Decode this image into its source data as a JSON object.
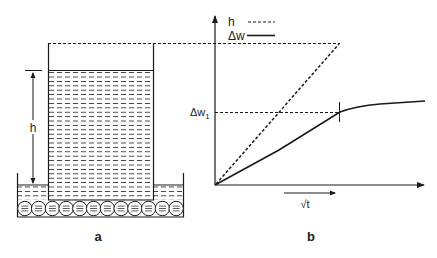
{
  "panel_a": {
    "label": "a",
    "height_label": "h",
    "circle_count": 12,
    "water_dash_rows": 22
  },
  "panel_b": {
    "label": "b",
    "legend": [
      {
        "name": "h",
        "style": "dashed"
      },
      {
        "name": "Δw",
        "style": "solid"
      }
    ],
    "y_marker_label": "Δw",
    "y_marker_subscript": "1",
    "x_axis_label": "√t"
  },
  "colors": {
    "line": "#1a1a1a",
    "background": "#ffffff"
  }
}
